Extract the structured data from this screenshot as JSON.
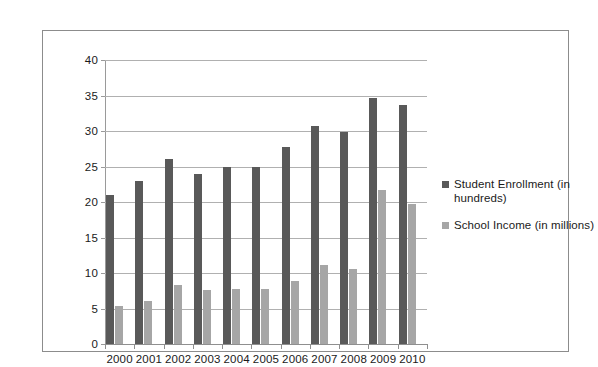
{
  "chart_data": {
    "type": "bar",
    "title": "",
    "subtitle": "",
    "xlabel": "",
    "ylabel": "",
    "ylim": [
      0,
      40
    ],
    "y_ticks": [
      0,
      5,
      10,
      15,
      20,
      25,
      30,
      35,
      40
    ],
    "grid": true,
    "legend_position": "right",
    "categories": [
      "2000",
      "2001",
      "2002",
      "2003",
      "2004",
      "2005",
      "2006",
      "2007",
      "2008",
      "2009",
      "2010"
    ],
    "series": [
      {
        "name": "Student Enrollment (in hundreds)",
        "color": "#595959",
        "values": [
          21.0,
          23.0,
          26.0,
          24.0,
          24.9,
          24.9,
          27.8,
          30.7,
          29.8,
          34.7,
          33.7
        ]
      },
      {
        "name": "School Income (in millions)",
        "color": "#a6a6a6",
        "values": [
          5.4,
          6.0,
          8.3,
          7.6,
          7.8,
          7.8,
          8.9,
          11.1,
          10.6,
          21.7,
          19.7
        ]
      }
    ]
  },
  "legend": {
    "entries": [
      {
        "label": "Student Enrollment (in hundreds)"
      },
      {
        "label": "School Income (in millions)"
      }
    ]
  },
  "colors": {
    "series_0": "#595959",
    "series_1": "#a6a6a6",
    "gridline": "#b0b0b0",
    "axis": "#8f8f8f",
    "frame": "#8c8c8c",
    "text": "#1a1a1a",
    "background": "#ffffff"
  }
}
